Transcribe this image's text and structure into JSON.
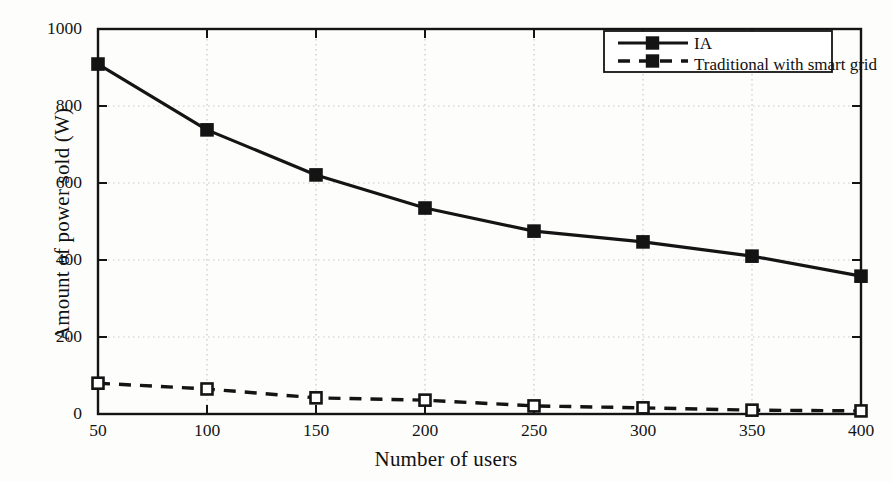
{
  "chart_data": {
    "type": "line",
    "title": "",
    "xlabel": "Number of users",
    "ylabel": "Amount of power sold (W)",
    "x": [
      50,
      100,
      150,
      200,
      250,
      300,
      350,
      400
    ],
    "xlim": [
      50,
      400
    ],
    "ylim": [
      0,
      1000
    ],
    "xticks": [
      "50",
      "100",
      "150",
      "200",
      "250",
      "300",
      "350",
      "400"
    ],
    "yticks": [
      "0",
      "200",
      "400",
      "600",
      "800",
      "1000"
    ],
    "grid": "dotted-both",
    "legend_position": "top-right",
    "series": [
      {
        "name": "IA",
        "values": [
          909,
          738,
          621,
          535,
          475,
          447,
          410,
          358
        ],
        "style": "solid",
        "marker": "square",
        "color": "#141414"
      },
      {
        "name": "Traditional with smart grid",
        "values": [
          80,
          65,
          42,
          36,
          21,
          16,
          10,
          8
        ],
        "style": "dashed",
        "marker": "square",
        "color": "#141414"
      }
    ],
    "legend": [
      {
        "label": "IA",
        "style": "solid"
      },
      {
        "label": "Traditional with smart grid",
        "style": "dashed"
      }
    ],
    "colors": {
      "axis": "#141414",
      "grid": "#c9c9c9",
      "background": "#fdfdfc",
      "series": "#141414"
    }
  }
}
